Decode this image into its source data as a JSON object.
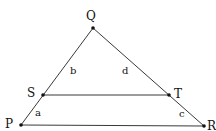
{
  "diagram": {
    "type": "triangle with parallel segment",
    "points": {
      "Q": {
        "label": "Q",
        "x": 93,
        "y": 28
      },
      "S": {
        "label": "S",
        "x": 43,
        "y": 95
      },
      "T": {
        "label": "T",
        "x": 169,
        "y": 95
      },
      "P": {
        "label": "P",
        "x": 21,
        "y": 125
      },
      "R": {
        "label": "R",
        "x": 204,
        "y": 126
      }
    },
    "segment_labels": {
      "b": "b",
      "d": "d",
      "a": "a",
      "c": "c"
    },
    "colors": {
      "stroke": "#222222",
      "point": "#111111"
    }
  }
}
